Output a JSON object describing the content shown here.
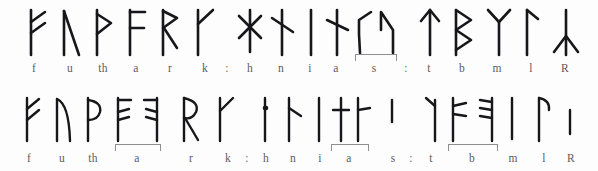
{
  "figure": {
    "background_color": "#fdfdfd",
    "ink_color": "#17161a",
    "label_color": "#5b5b60",
    "bracket_color": "#8e8e93",
    "rows": [
      {
        "id": "row-top",
        "name": "long-branch-futhark-row",
        "labels": [
          {
            "text": "f",
            "x": 34,
            "y": 62
          },
          {
            "text": "u",
            "x": 70,
            "y": 62
          },
          {
            "text": "th",
            "x": 103,
            "y": 62
          },
          {
            "text": "a",
            "x": 136,
            "y": 62
          },
          {
            "text": "r",
            "x": 170,
            "y": 62
          },
          {
            "text": "k",
            "x": 205,
            "y": 62
          },
          {
            "text": ":",
            "x": 227,
            "y": 62
          },
          {
            "text": "h",
            "x": 250,
            "y": 62
          },
          {
            "text": "n",
            "x": 281,
            "y": 62
          },
          {
            "text": "i",
            "x": 310,
            "y": 62
          },
          {
            "text": "a",
            "x": 336,
            "y": 62
          },
          {
            "text": "s",
            "x": 374,
            "y": 62
          },
          {
            "text": ":",
            "x": 406,
            "y": 62
          },
          {
            "text": "t",
            "x": 429,
            "y": 62
          },
          {
            "text": "b",
            "x": 462,
            "y": 62
          },
          {
            "text": "m",
            "x": 497,
            "y": 62
          },
          {
            "text": "l",
            "x": 531,
            "y": 62
          },
          {
            "text": "R",
            "x": 565,
            "y": 62
          }
        ],
        "brackets": [
          {
            "name": "bracket-s",
            "x": 355,
            "y": 54,
            "width": 40
          }
        ]
      },
      {
        "id": "row-bottom",
        "name": "short-twig-futhark-row",
        "labels": [
          {
            "text": "f",
            "x": 29,
            "y": 152
          },
          {
            "text": "u",
            "x": 62,
            "y": 152
          },
          {
            "text": "th",
            "x": 93,
            "y": 152
          },
          {
            "text": "a",
            "x": 135,
            "y": 152
          },
          {
            "text": "r",
            "x": 190,
            "y": 152
          },
          {
            "text": "k",
            "x": 228,
            "y": 152
          },
          {
            "text": ":",
            "x": 247,
            "y": 152
          },
          {
            "text": "h",
            "x": 265,
            "y": 152
          },
          {
            "text": "n",
            "x": 293,
            "y": 152
          },
          {
            "text": "i",
            "x": 320,
            "y": 152
          },
          {
            "text": "a",
            "x": 348,
            "y": 152
          },
          {
            "text": "s",
            "x": 392,
            "y": 152
          },
          {
            "text": ":",
            "x": 411,
            "y": 152
          },
          {
            "text": "t",
            "x": 430,
            "y": 152
          },
          {
            "text": "b",
            "x": 471,
            "y": 152
          },
          {
            "text": "m",
            "x": 513,
            "y": 152
          },
          {
            "text": "l",
            "x": 543,
            "y": 152
          },
          {
            "text": "R",
            "x": 570,
            "y": 152
          }
        ],
        "brackets": [
          {
            "name": "bracket-a",
            "x": 115,
            "y": 144,
            "width": 44
          },
          {
            "name": "bracket-a-2",
            "x": 331,
            "y": 144,
            "width": 36
          },
          {
            "name": "bracket-b",
            "x": 448,
            "y": 144,
            "width": 48
          }
        ]
      }
    ]
  },
  "runes": {
    "top": [
      {
        "name": "rune-f",
        "transliteration": "f",
        "x": 26,
        "y": 8,
        "w": 22,
        "h": 48
      },
      {
        "name": "rune-u",
        "transliteration": "u",
        "x": 60,
        "y": 8,
        "w": 22,
        "h": 48
      },
      {
        "name": "rune-th",
        "transliteration": "th",
        "x": 93,
        "y": 8,
        "w": 22,
        "h": 48
      },
      {
        "name": "rune-a",
        "transliteration": "a",
        "x": 126,
        "y": 8,
        "w": 22,
        "h": 48
      },
      {
        "name": "rune-r",
        "transliteration": "r",
        "x": 159,
        "y": 8,
        "w": 22,
        "h": 48
      },
      {
        "name": "rune-k",
        "transliteration": "k",
        "x": 194,
        "y": 8,
        "w": 22,
        "h": 48
      },
      {
        "name": "rune-h",
        "transliteration": "h",
        "x": 239,
        "y": 8,
        "w": 24,
        "h": 48
      },
      {
        "name": "rune-n",
        "transliteration": "n",
        "x": 271,
        "y": 8,
        "w": 22,
        "h": 48
      },
      {
        "name": "rune-i",
        "transliteration": "i",
        "x": 302,
        "y": 8,
        "w": 16,
        "h": 48
      },
      {
        "name": "rune-a2",
        "transliteration": "a",
        "x": 326,
        "y": 8,
        "w": 22,
        "h": 48
      },
      {
        "name": "rune-s-1",
        "transliteration": "s",
        "x": 356,
        "y": 8,
        "w": 20,
        "h": 48
      },
      {
        "name": "rune-s-2",
        "transliteration": "s",
        "x": 378,
        "y": 8,
        "w": 20,
        "h": 48
      },
      {
        "name": "rune-t",
        "transliteration": "t",
        "x": 419,
        "y": 8,
        "w": 22,
        "h": 48
      },
      {
        "name": "rune-b",
        "transliteration": "b",
        "x": 452,
        "y": 8,
        "w": 22,
        "h": 48
      },
      {
        "name": "rune-m",
        "transliteration": "m",
        "x": 486,
        "y": 8,
        "w": 24,
        "h": 48
      },
      {
        "name": "rune-l",
        "transliteration": "l",
        "x": 522,
        "y": 8,
        "w": 20,
        "h": 48
      },
      {
        "name": "rune-R",
        "transliteration": "R",
        "x": 553,
        "y": 8,
        "w": 26,
        "h": 48
      }
    ],
    "bottom": [
      {
        "name": "rune-f-st",
        "transliteration": "f",
        "x": 22,
        "y": 96,
        "w": 20,
        "h": 46
      },
      {
        "name": "rune-u-st",
        "transliteration": "u",
        "x": 53,
        "y": 96,
        "w": 20,
        "h": 46
      },
      {
        "name": "rune-th-st",
        "transliteration": "th",
        "x": 84,
        "y": 96,
        "w": 20,
        "h": 46
      },
      {
        "name": "rune-a-st-1",
        "transliteration": "a",
        "x": 114,
        "y": 96,
        "w": 20,
        "h": 46
      },
      {
        "name": "rune-a-st-2",
        "transliteration": "a",
        "x": 140,
        "y": 96,
        "w": 20,
        "h": 46
      },
      {
        "name": "rune-r-st",
        "transliteration": "r",
        "x": 180,
        "y": 96,
        "w": 22,
        "h": 46
      },
      {
        "name": "rune-k-st",
        "transliteration": "k",
        "x": 216,
        "y": 96,
        "w": 20,
        "h": 46
      },
      {
        "name": "rune-h-st",
        "transliteration": "h",
        "x": 256,
        "y": 96,
        "w": 18,
        "h": 46
      },
      {
        "name": "rune-n-st",
        "transliteration": "n",
        "x": 283,
        "y": 96,
        "w": 20,
        "h": 46
      },
      {
        "name": "rune-i-st",
        "transliteration": "i",
        "x": 313,
        "y": 96,
        "w": 14,
        "h": 46
      },
      {
        "name": "rune-a-st-3",
        "transliteration": "a",
        "x": 332,
        "y": 96,
        "w": 18,
        "h": 46
      },
      {
        "name": "rune-a-st-4",
        "transliteration": "a",
        "x": 352,
        "y": 96,
        "w": 18,
        "h": 46
      },
      {
        "name": "rune-s-st",
        "transliteration": "s",
        "x": 386,
        "y": 96,
        "w": 14,
        "h": 46
      },
      {
        "name": "rune-t-st",
        "transliteration": "t",
        "x": 422,
        "y": 96,
        "w": 20,
        "h": 46
      },
      {
        "name": "rune-b-st-1",
        "transliteration": "b",
        "x": 449,
        "y": 96,
        "w": 20,
        "h": 46
      },
      {
        "name": "rune-b-st-2",
        "transliteration": "b",
        "x": 475,
        "y": 96,
        "w": 20,
        "h": 46
      },
      {
        "name": "rune-m-st",
        "transliteration": "m",
        "x": 506,
        "y": 96,
        "w": 14,
        "h": 46
      },
      {
        "name": "rune-l-st",
        "transliteration": "l",
        "x": 534,
        "y": 96,
        "w": 20,
        "h": 46
      },
      {
        "name": "rune-R-st",
        "transliteration": "R",
        "x": 564,
        "y": 96,
        "w": 14,
        "h": 46
      }
    ]
  }
}
